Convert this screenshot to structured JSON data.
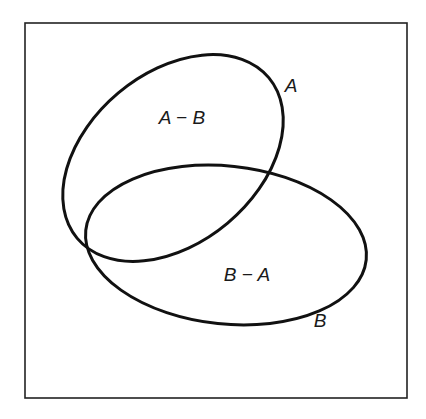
{
  "diagram": {
    "type": "venn",
    "universe_box": {
      "x": 25,
      "y": 23,
      "width": 382,
      "height": 375,
      "stroke": "#222222"
    },
    "sets": [
      {
        "name": "A",
        "label": "A",
        "label_pos": [
          291,
          92
        ],
        "ellipse": {
          "cx": 173,
          "cy": 158,
          "rx": 125,
          "ry": 85,
          "rotate": -40
        }
      },
      {
        "name": "B",
        "label": "B",
        "label_pos": [
          320,
          327
        ],
        "ellipse": {
          "cx": 226,
          "cy": 245,
          "rx": 141,
          "ry": 79,
          "rotate": 6
        }
      }
    ],
    "regions": [
      {
        "name": "A-minus-B",
        "label": "A − B",
        "label_pos": [
          182,
          124
        ]
      },
      {
        "name": "B-minus-A",
        "label": "B − A",
        "label_pos": [
          247,
          281
        ]
      }
    ],
    "colors": {
      "stroke": "#111111",
      "background": "#ffffff"
    }
  }
}
